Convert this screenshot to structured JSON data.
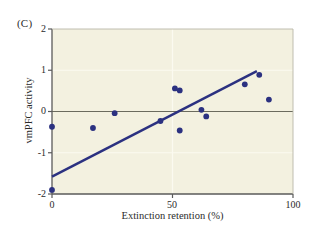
{
  "panel": {
    "label": "(C)"
  },
  "axes": {
    "xlabel": "Extinction retention (%)",
    "ylabel": "vmPFC activity",
    "xticks": [
      "0",
      "50",
      "100"
    ],
    "yticks": [
      "2",
      "1",
      "0",
      "-1",
      "-2"
    ],
    "xlim": [
      0,
      100
    ],
    "ylim": [
      -2,
      2
    ]
  },
  "colors": {
    "plot_background": "#f3f1e0",
    "point_color": "#2b3180",
    "line_color": "#2b3180",
    "zero_line_color": "#6b6b5e",
    "frame_color": "#5a5a5a",
    "text_color": "#2b2b2b",
    "gridline_color": "#fbfaf0"
  },
  "chart_data": {
    "type": "scatter",
    "title": "(C)",
    "xlabel": "Extinction retention (%)",
    "ylabel": "vmPFC activity",
    "xlim": [
      0,
      100
    ],
    "ylim": [
      -2,
      2
    ],
    "xticks": [
      0,
      50,
      100
    ],
    "yticks": [
      -2,
      -1,
      0,
      1,
      2
    ],
    "grid": true,
    "legend": "none",
    "points": [
      {
        "x": 0,
        "y": -0.37
      },
      {
        "x": 0,
        "y": -1.9
      },
      {
        "x": 17,
        "y": -0.4
      },
      {
        "x": 26,
        "y": -0.04
      },
      {
        "x": 45,
        "y": -0.23
      },
      {
        "x": 51,
        "y": 0.56
      },
      {
        "x": 53,
        "y": 0.51
      },
      {
        "x": 53,
        "y": -0.46
      },
      {
        "x": 62,
        "y": 0.04
      },
      {
        "x": 64,
        "y": -0.12
      },
      {
        "x": 80,
        "y": 0.66
      },
      {
        "x": 86,
        "y": 0.89
      },
      {
        "x": 90,
        "y": 0.29
      }
    ],
    "regression_line": {
      "x0": 0,
      "y0": -1.58,
      "x1": 85,
      "y1": 0.98
    },
    "reference_lines": [
      {
        "orientation": "horizontal",
        "value": 0
      }
    ]
  }
}
